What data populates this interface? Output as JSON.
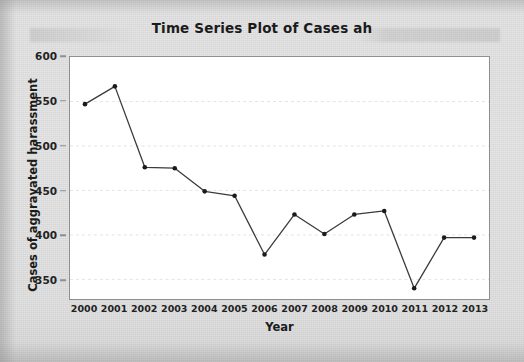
{
  "chart_data": {
    "type": "line",
    "title": "Time Series Plot of Cases ah",
    "xlabel": "Year",
    "ylabel": "Cases of aggravated harassment",
    "categories": [
      "2000",
      "2001",
      "2002",
      "2003",
      "2004",
      "2005",
      "2006",
      "2007",
      "2008",
      "2009",
      "2010",
      "2011",
      "2012",
      "2013"
    ],
    "x": [
      2000,
      2001,
      2002,
      2003,
      2004,
      2005,
      2006,
      2007,
      2008,
      2009,
      2010,
      2011,
      2012,
      2013
    ],
    "values": [
      547,
      567,
      476,
      475,
      449,
      444,
      378,
      423,
      401,
      423,
      427,
      340,
      397,
      397
    ],
    "series": [
      {
        "name": "Cases of aggravated harassment",
        "values": [
          547,
          567,
          476,
          475,
          449,
          444,
          378,
          423,
          401,
          423,
          427,
          340,
          397,
          397
        ]
      }
    ],
    "ylim": [
      328,
      600
    ],
    "xlim": [
      1999.5,
      2013.5
    ],
    "yticks": [
      350,
      400,
      450,
      500,
      550,
      600
    ],
    "ytick_labels": [
      "350",
      "400",
      "450",
      "500",
      "550",
      "600"
    ],
    "xtick_labels": [
      "2000",
      "2001",
      "2002",
      "2003",
      "2004",
      "2005",
      "2006",
      "2007",
      "2008",
      "2009",
      "2010",
      "2011",
      "2012",
      "2013"
    ],
    "grid": true,
    "grid_axis": "y",
    "legend": "none",
    "marker": "filled-circle",
    "line_color": "#3b3b3b",
    "marker_color": "#1a1a1a",
    "grid_color": "#e3e3ea",
    "plot_background": "#ffffff",
    "figure_background": "#dcdcdc",
    "frame_color": "#8f8f8f"
  }
}
